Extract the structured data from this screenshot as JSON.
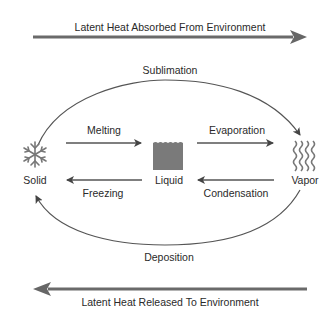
{
  "top_arrow": {
    "label": "Latent Heat Absorbed From Environment",
    "direction": "right"
  },
  "bottom_arrow": {
    "label": "Latent Heat Released To Environment",
    "direction": "left"
  },
  "states": [
    {
      "name": "Solid",
      "icon": "snowflake-icon"
    },
    {
      "name": "Liquid",
      "icon": "water-block-icon"
    },
    {
      "name": "Vapor",
      "icon": "vapor-waves-icon"
    }
  ],
  "transitions": {
    "melting": "Melting",
    "freezing": "Freezing",
    "evaporation": "Evaporation",
    "condensation": "Condensation",
    "sublimation": "Sublimation",
    "deposition": "Deposition"
  },
  "colors": {
    "arrow": "#555555",
    "thick_arrow": "#666666",
    "liquid_fill": "#777777",
    "text": "#2a2a2a"
  }
}
